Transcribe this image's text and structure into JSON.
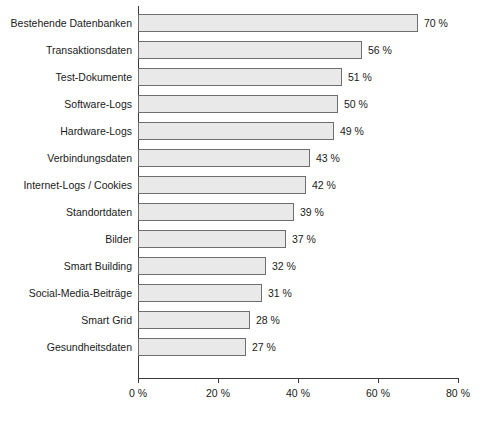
{
  "chart_data": {
    "type": "bar",
    "orientation": "horizontal",
    "title": "",
    "xlabel": "",
    "ylabel": "",
    "xlim": [
      0,
      80
    ],
    "xticks": [
      0,
      20,
      40,
      60,
      80
    ],
    "xtick_labels": [
      "0 %",
      "20 %",
      "40 %",
      "60 %",
      "80 %"
    ],
    "grid": false,
    "legend": null,
    "value_suffix": " %",
    "categories": [
      "Bestehende Datenbanken",
      "Transaktionsdaten",
      "Test-Dokumente",
      "Software-Logs",
      "Hardware-Logs",
      "Verbindungsdaten",
      "Internet-Logs / Cookies",
      "Standortdaten",
      "Bilder",
      "Smart Building",
      "Social-Media-Beiträge",
      "Smart Grid",
      "Gesundheitsdaten"
    ],
    "values": [
      70,
      56,
      51,
      50,
      49,
      43,
      42,
      39,
      37,
      32,
      31,
      28,
      27
    ],
    "value_labels": [
      "70 %",
      "56 %",
      "51 %",
      "50 %",
      "49 %",
      "43 %",
      "42 %",
      "39 %",
      "37 %",
      "32 %",
      "31 %",
      "28 %",
      "27 %"
    ],
    "colors": {
      "bar_fill": "#e9e9e9",
      "bar_border": "#6e6e6e",
      "axis": "#3a3a3a",
      "text": "#1a1a1a",
      "background": "#ffffff"
    }
  },
  "caption": {
    "text": "",
    "note": "cut off at image edge"
  }
}
